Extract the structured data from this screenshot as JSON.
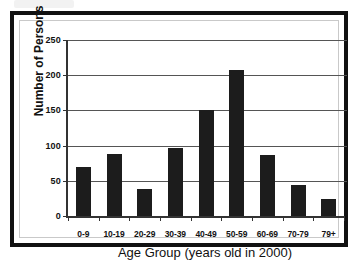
{
  "figure": {
    "background_color": "#ffffff",
    "frame_color": "#111111",
    "bar_color": "#1c1c1c",
    "grid_color": "#555555",
    "axis_color": "#333333"
  },
  "chart_data": {
    "type": "bar",
    "title": "",
    "subtitle": "",
    "xlabel": "Age Group (years old in 2000)",
    "ylabel": "Number of Persons",
    "categories": [
      "0-9",
      "10-19",
      "20-29",
      "30-39",
      "40-49",
      "50-59",
      "60-69",
      "70-79",
      "79+"
    ],
    "values": [
      69,
      88,
      38,
      97,
      151,
      208,
      86,
      44,
      24
    ],
    "ylim": [
      0,
      250
    ],
    "yticks": [
      0,
      50,
      100,
      150,
      200,
      250
    ],
    "ytick_labels": [
      "0",
      "50",
      "100",
      "150",
      "200",
      "250"
    ],
    "grid": "horizontal",
    "legend": "none",
    "annotations": []
  }
}
